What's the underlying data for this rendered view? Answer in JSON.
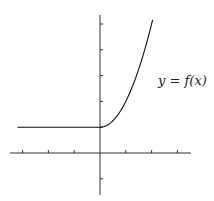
{
  "chart_data": {
    "type": "line",
    "title": "",
    "xlabel": "",
    "ylabel": "",
    "annotation": "y = f(x)",
    "xlim": [
      -3.5,
      3.5
    ],
    "ylim": [
      -1.6,
      5.4
    ],
    "x_ticks": [
      -3,
      -2,
      -1,
      1,
      2,
      3
    ],
    "y_ticks": [
      -1,
      1,
      2,
      3,
      4,
      5
    ],
    "grid": false,
    "series": [
      {
        "name": "f(x)",
        "description": "f(x) = 1 for x < 0; f(x) = 1 + x^2 for x >= 0",
        "x": [
          -3.2,
          -2,
          -1,
          0,
          0.5,
          1,
          1.5,
          2,
          2.05
        ],
        "values": [
          1,
          1,
          1,
          1,
          1.25,
          2,
          3.25,
          5,
          5.2
        ]
      }
    ]
  },
  "label": {
    "text": "y = f(x)"
  },
  "colors": {
    "axis": "#222222",
    "curve": "#111111",
    "background": "#ffffff"
  }
}
